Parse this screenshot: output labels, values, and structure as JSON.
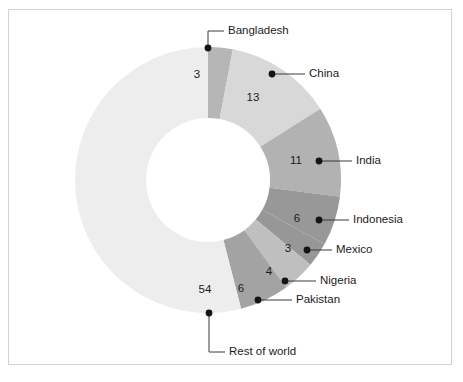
{
  "figure": {
    "background_color": "#ffffff",
    "border_color": "#d2d2d2",
    "footer_note": ""
  },
  "chart_data": {
    "type": "pie",
    "variant": "donut",
    "title": "",
    "subtitle": "",
    "xlabel": "",
    "ylabel": "",
    "units": "percent",
    "total": 100,
    "start_angle_deg": 0,
    "direction": "clockwise",
    "inner_radius_ratio": 0.47,
    "legend_position": "none",
    "labels_style": "callout-with-leader-lines",
    "grid": false,
    "categories": [
      "Bangladesh",
      "China",
      "India",
      "Indonesia",
      "Mexico",
      "Nigeria",
      "Pakistan",
      "Rest of world"
    ],
    "values": [
      3,
      13,
      11,
      6,
      3,
      4,
      6,
      54
    ],
    "colors": [
      "#b6b6b6",
      "#d8d8d8",
      "#b2b2b2",
      "#989898",
      "#979797",
      "#bfbfbf",
      "#a3a3a3",
      "#ededed"
    ],
    "slices": [
      {
        "label": "Bangladesh",
        "value": 3,
        "value_text": "3",
        "color": "#b6b6b6"
      },
      {
        "label": "China",
        "value": 13,
        "value_text": "13",
        "color": "#d8d8d8"
      },
      {
        "label": "India",
        "value": 11,
        "value_text": "11",
        "color": "#b2b2b2"
      },
      {
        "label": "Indonesia",
        "value": 6,
        "value_text": "6",
        "color": "#989898"
      },
      {
        "label": "Mexico",
        "value": 3,
        "value_text": "3",
        "color": "#979797"
      },
      {
        "label": "Nigeria",
        "value": 4,
        "value_text": "4",
        "color": "#bfbfbf"
      },
      {
        "label": "Pakistan",
        "value": 6,
        "value_text": "6",
        "color": "#a3a3a3"
      },
      {
        "label": "Rest of world",
        "value": 54,
        "value_text": "54",
        "color": "#ededed"
      }
    ]
  },
  "geometry": {
    "center_x": 208,
    "center_y": 180,
    "outer_radius": 133,
    "inner_radius": 62
  },
  "callouts": [
    {
      "label": "Bangladesh",
      "dot_x": 208,
      "dot_y": 48,
      "elbow_x": 208,
      "elbow_y": 31,
      "text_x": 228,
      "text_y": 31,
      "anchor": "start"
    },
    {
      "label": "China",
      "dot_x": 272,
      "dot_y": 74,
      "elbow_x": 272,
      "elbow_y": 74,
      "text_x": 309,
      "text_y": 74,
      "anchor": "start"
    },
    {
      "label": "India",
      "dot_x": 319,
      "dot_y": 161,
      "elbow_x": 319,
      "elbow_y": 161,
      "text_x": 356,
      "text_y": 161,
      "anchor": "start"
    },
    {
      "label": "Indonesia",
      "dot_x": 319,
      "dot_y": 220,
      "elbow_x": 319,
      "elbow_y": 220,
      "text_x": 353,
      "text_y": 220,
      "anchor": "start"
    },
    {
      "label": "Mexico",
      "dot_x": 307,
      "dot_y": 250,
      "elbow_x": 307,
      "elbow_y": 250,
      "text_x": 336,
      "text_y": 250,
      "anchor": "start"
    },
    {
      "label": "Nigeria",
      "dot_x": 285,
      "dot_y": 281,
      "elbow_x": 285,
      "elbow_y": 281,
      "text_x": 320,
      "text_y": 281,
      "anchor": "start"
    },
    {
      "label": "Pakistan",
      "dot_x": 258,
      "dot_y": 300,
      "elbow_x": 258,
      "elbow_y": 300,
      "text_x": 296,
      "text_y": 300,
      "anchor": "start"
    },
    {
      "label": "Rest of world",
      "dot_x": 209,
      "dot_y": 313,
      "elbow_x": 209,
      "elbow_y": 352,
      "text_x": 229,
      "text_y": 352,
      "anchor": "start"
    }
  ],
  "value_labels": [
    {
      "text": "3",
      "x": 197,
      "y": 75
    },
    {
      "text": "13",
      "x": 253,
      "y": 98
    },
    {
      "text": "11",
      "x": 296,
      "y": 161
    },
    {
      "text": "6",
      "x": 297,
      "y": 219
    },
    {
      "text": "3",
      "x": 288,
      "y": 249
    },
    {
      "text": "4",
      "x": 269,
      "y": 272
    },
    {
      "text": "6",
      "x": 241,
      "y": 289
    },
    {
      "text": "54",
      "x": 205,
      "y": 290
    }
  ]
}
